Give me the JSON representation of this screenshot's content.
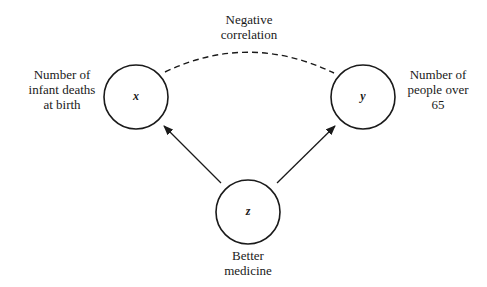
{
  "diagram": {
    "nodes": [
      {
        "id": "x",
        "symbol": "x",
        "label_lines": [
          "Number of",
          "infant deaths",
          "at birth"
        ]
      },
      {
        "id": "y",
        "symbol": "y",
        "label_lines": [
          "Number of",
          "people over",
          "65"
        ]
      },
      {
        "id": "z",
        "symbol": "z",
        "label_lines": [
          "Better",
          "medicine"
        ]
      }
    ],
    "edges": [
      {
        "from": "z",
        "to": "x",
        "style": "solid-arrow"
      },
      {
        "from": "z",
        "to": "y",
        "style": "solid-arrow"
      },
      {
        "from": "x",
        "to": "y",
        "style": "dashed-curve",
        "label_lines": [
          "Negative",
          "correlation"
        ]
      }
    ],
    "colors": {
      "stroke": "#1a1a1a",
      "background": "#ffffff"
    }
  }
}
